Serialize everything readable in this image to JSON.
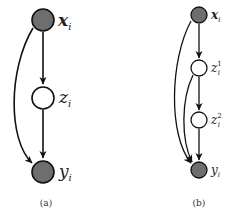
{
  "panels": [
    {
      "caption": "(a)",
      "nodes": [
        {
          "id": "x",
          "label": "x",
          "sub": "i",
          "sup": "",
          "observed": true,
          "bold": true
        },
        {
          "id": "z",
          "label": "z",
          "sub": "i",
          "sup": "",
          "observed": false,
          "bold": false
        },
        {
          "id": "y",
          "label": "y",
          "sub": "i",
          "sup": "",
          "observed": true,
          "bold": false
        }
      ],
      "edges": [
        [
          "x",
          "z"
        ],
        [
          "z",
          "y"
        ],
        [
          "x",
          "y"
        ]
      ]
    },
    {
      "caption": "(b)",
      "nodes": [
        {
          "id": "x",
          "label": "x",
          "sub": "i",
          "sup": "",
          "observed": true,
          "bold": true
        },
        {
          "id": "z1",
          "label": "z",
          "sub": "i",
          "sup": "1",
          "observed": false,
          "bold": false
        },
        {
          "id": "z2",
          "label": "z",
          "sub": "i",
          "sup": "2",
          "observed": false,
          "bold": false
        },
        {
          "id": "y",
          "label": "y",
          "sub": "i",
          "sup": "",
          "observed": true,
          "bold": false
        }
      ],
      "edges": [
        [
          "x",
          "z1"
        ],
        [
          "z1",
          "z2"
        ],
        [
          "z2",
          "y"
        ],
        [
          "x",
          "y"
        ],
        [
          "z1",
          "y"
        ]
      ]
    }
  ],
  "colors": {
    "observed_fill": "#6e6e6e",
    "latent_fill": "#ffffff",
    "stroke": "#111111"
  }
}
